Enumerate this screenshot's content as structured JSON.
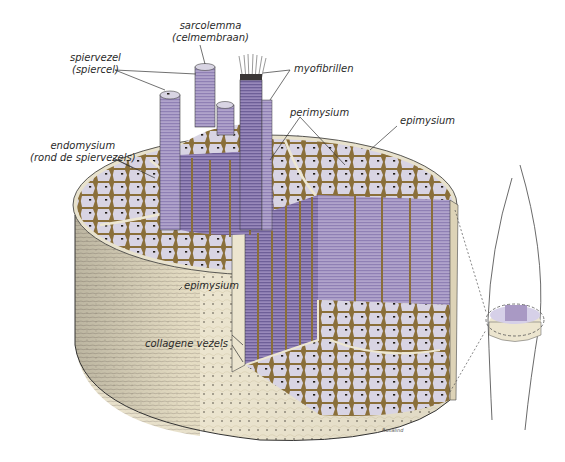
{
  "figure": {
    "colors": {
      "background": "#ffffff",
      "epimysium_surface": "#ebe3cc",
      "fiber_purple": "#a999c4",
      "fiber_purple_dark": "#7d6fa0",
      "fiber_cross_section": "#d9d5e4",
      "connective_tissue": "#8a6f3a",
      "nucleus": "#1f1a16",
      "line": "#333333"
    }
  },
  "labels": {
    "sarcolemma": {
      "line1": "sarcolemma",
      "line2": "(celmembraan)"
    },
    "spiervezel": {
      "line1": "spiervezel",
      "line2": "(spiercel)"
    },
    "myofibrillen": "myofibrillen",
    "perimysium": "perimysium",
    "epimysium_top": "epimysium",
    "endomysium": {
      "line1": "endomysium",
      "line2": "(rond de spiervezels)"
    },
    "epimysium_side": "epimysium",
    "collagene_vezels": "collagene vezels"
  },
  "signature": "Rosalind"
}
